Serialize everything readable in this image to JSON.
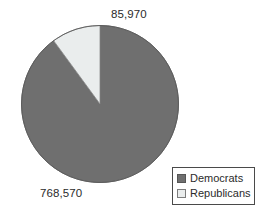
{
  "chart_data": {
    "type": "pie",
    "title": "",
    "xlabel": "",
    "ylabel": "",
    "grid": false,
    "legend_position": "bottom-right",
    "categories": [
      "Democrats",
      "Republicans"
    ],
    "values": [
      768570,
      85970
    ],
    "value_labels": [
      "768,570",
      "85,970"
    ],
    "series": [
      {
        "name": "Voters",
        "values": [
          768570,
          85970
        ]
      }
    ],
    "slices": [
      {
        "label": "Democrats",
        "value": 768570,
        "value_label": "768,570",
        "percent": 89.9,
        "color": "#6f6f6f",
        "start_angle_deg": 36.2,
        "end_angle_deg": 360.0
      },
      {
        "label": "Republicans",
        "value": 85970,
        "value_label": "85,970",
        "percent": 10.1,
        "color": "#eaeded",
        "start_angle_deg": 0.0,
        "end_angle_deg": 36.2
      }
    ],
    "total": 854540
  },
  "labels": {
    "republicans_value": "85,970",
    "democrats_value": "768,570"
  },
  "legend": {
    "items": [
      {
        "label": "Democrats",
        "color": "#6f6f6f"
      },
      {
        "label": "Republicans",
        "color": "#eaeded"
      }
    ]
  },
  "colors": {
    "democrats": "#6f6f6f",
    "republicans": "#eaeded",
    "outline": "#5a5a5a",
    "text": "#2b2b2b",
    "background": "#ffffff"
  }
}
